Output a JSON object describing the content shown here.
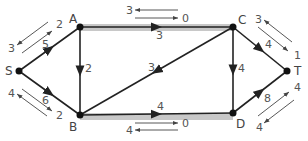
{
  "diagram": {
    "type": "flow-network",
    "colors": {
      "edge": "#222222",
      "highlight": "#c8c8c8",
      "text": "#555555"
    },
    "nodes": [
      {
        "id": "S",
        "label": "S",
        "x": 19,
        "y": 71
      },
      {
        "id": "A",
        "label": "A",
        "x": 80,
        "y": 27
      },
      {
        "id": "B",
        "label": "B",
        "x": 80,
        "y": 115
      },
      {
        "id": "C",
        "label": "C",
        "x": 233,
        "y": 27
      },
      {
        "id": "D",
        "label": "D",
        "x": 233,
        "y": 113
      },
      {
        "id": "T",
        "label": "T",
        "x": 287,
        "y": 71
      }
    ],
    "edges": [
      {
        "from": "S",
        "to": "A",
        "label": "5",
        "highlighted": false
      },
      {
        "from": "S",
        "to": "B",
        "label": "6",
        "highlighted": false
      },
      {
        "from": "A",
        "to": "B",
        "label": "2",
        "highlighted": false
      },
      {
        "from": "A",
        "to": "C",
        "label": "3",
        "highlighted": true
      },
      {
        "from": "C",
        "to": "B",
        "label": "3",
        "highlighted": false
      },
      {
        "from": "B",
        "to": "D",
        "label": "4",
        "highlighted": true
      },
      {
        "from": "C",
        "to": "D",
        "label": "4",
        "highlighted": false
      },
      {
        "from": "C",
        "to": "T",
        "label": "4",
        "highlighted": false
      },
      {
        "from": "D",
        "to": "T",
        "label": "8",
        "highlighted": false
      }
    ],
    "flow_arrows": [
      {
        "edge": "S-A",
        "forward": "2",
        "backward": "3"
      },
      {
        "edge": "S-B",
        "forward": "2",
        "backward": "4"
      },
      {
        "edge": "A-C",
        "forward": "0",
        "backward": "3"
      },
      {
        "edge": "B-D",
        "forward": "0",
        "backward": "4"
      },
      {
        "edge": "C-T",
        "forward": "1",
        "backward": "3"
      },
      {
        "edge": "D-T",
        "forward": "4",
        "backward": "4"
      }
    ]
  }
}
